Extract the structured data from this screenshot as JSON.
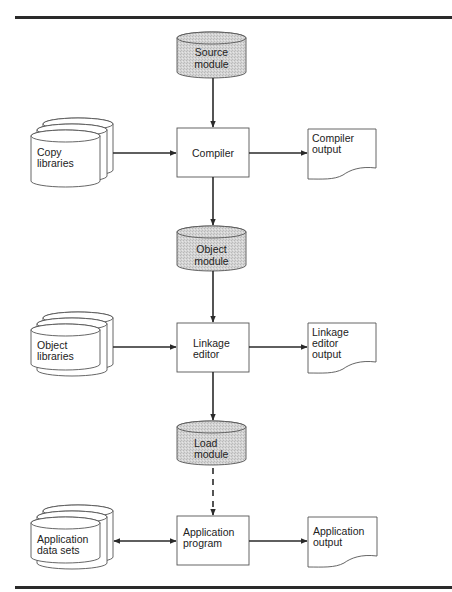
{
  "diagram": {
    "colors": {
      "stored_module_fill": "#d2d2d2",
      "line": "#2a2a2a",
      "outline": "#555555",
      "background": "#ffffff"
    },
    "nodes": {
      "source_module": {
        "type": "storage-cylinder-shaded",
        "line1": "Source",
        "line2": "module"
      },
      "copy_libraries": {
        "type": "stacked-cylinders",
        "line1": "Copy",
        "line2": "libraries"
      },
      "compiler": {
        "type": "process-box",
        "line1": "Compiler"
      },
      "compiler_output": {
        "type": "document",
        "line1": "Compiler",
        "line2": "output"
      },
      "object_module": {
        "type": "storage-cylinder-shaded",
        "line1": "Object",
        "line2": "module"
      },
      "object_libraries": {
        "type": "stacked-cylinders",
        "line1": "Object",
        "line2": "libraries"
      },
      "linkage_editor": {
        "type": "process-box",
        "line1": "Linkage",
        "line2": "editor"
      },
      "linkage_editor_output": {
        "type": "document",
        "line1": "Linkage",
        "line2": "editor",
        "line3": "output"
      },
      "load_module": {
        "type": "storage-cylinder-shaded",
        "line1": "Load",
        "line2": "module"
      },
      "application_data_sets": {
        "type": "stacked-cylinders",
        "line1": "Application",
        "line2": "data sets"
      },
      "application_program": {
        "type": "process-box",
        "line1": "Application",
        "line2": "program"
      },
      "application_output": {
        "type": "document",
        "line1": "Application",
        "line2": "output"
      }
    },
    "edges": [
      {
        "from": "Source module",
        "to": "Compiler",
        "style": "solid"
      },
      {
        "from": "Copy libraries",
        "to": "Compiler",
        "style": "solid"
      },
      {
        "from": "Compiler",
        "to": "Compiler output",
        "style": "solid"
      },
      {
        "from": "Compiler",
        "to": "Object module",
        "style": "solid"
      },
      {
        "from": "Object module",
        "to": "Linkage editor",
        "style": "solid"
      },
      {
        "from": "Object libraries",
        "to": "Linkage editor",
        "style": "solid"
      },
      {
        "from": "Linkage editor",
        "to": "Linkage editor output",
        "style": "solid"
      },
      {
        "from": "Linkage editor",
        "to": "Load module",
        "style": "solid"
      },
      {
        "from": "Load module",
        "to": "Application program",
        "style": "dashed"
      },
      {
        "from": "Application data sets",
        "to": "Application program",
        "style": "solid",
        "bidirectional": true
      },
      {
        "from": "Application program",
        "to": "Application output",
        "style": "solid"
      }
    ]
  }
}
